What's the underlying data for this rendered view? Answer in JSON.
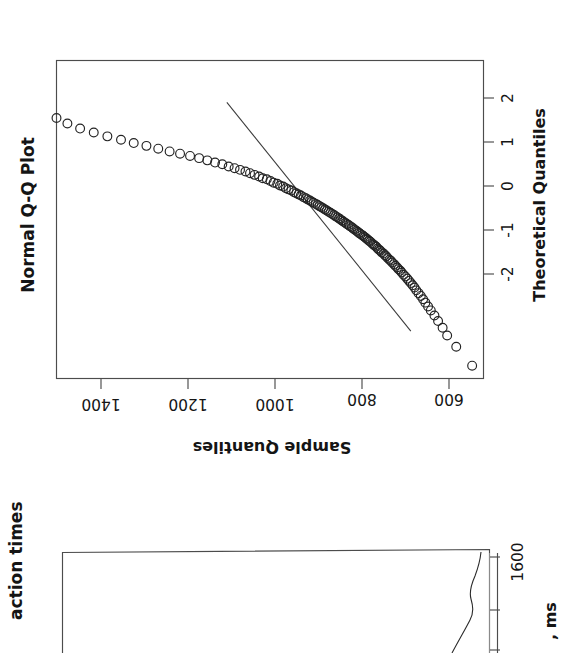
{
  "figure": {
    "orientation": "rotated-90-ccw",
    "background": "#ffffff",
    "ink_color": "#232323"
  },
  "panels": {
    "qq": {
      "title": "Normal Q-Q Plot",
      "x_axis_label": "Theoretical Quantiles",
      "y_axis_label": "Sample Quantiles",
      "x_ticks": [
        "-2",
        "-1",
        "0",
        "1",
        "2"
      ],
      "y_ticks": [
        "600",
        "800",
        "1000",
        "1200",
        "1400"
      ]
    },
    "density": {
      "title_visible_fragment": "action times",
      "x_axis_label_visible_fragment": ", ms",
      "x_ticks_visible": [
        "1600"
      ],
      "note": "panel is cropped by the bottom edge of the screenshot"
    }
  },
  "chart_data": [
    {
      "type": "scatter",
      "title": "Normal Q-Q Plot",
      "xlabel": "Theoretical Quantiles",
      "ylabel": "Sample Quantiles",
      "xlim": [
        -2.85,
        2.85
      ],
      "ylim": [
        540,
        1480
      ],
      "xticks": [
        -2,
        -1,
        0,
        1,
        2
      ],
      "yticks": [
        600,
        800,
        1000,
        1200,
        1400
      ],
      "grid": false,
      "legend": null,
      "marker": "open-circle",
      "reference_line": {
        "label": "qqline",
        "x": [
          -2.0,
          2.1
        ],
        "y": [
          700.0,
          1105.0
        ]
      },
      "x": [
        -2.62,
        -2.28,
        -2.08,
        -1.94,
        -1.82,
        -1.72,
        -1.63,
        -1.56,
        -1.49,
        -1.43,
        -1.37,
        -1.32,
        -1.27,
        -1.22,
        -1.18,
        -1.14,
        -1.1,
        -1.06,
        -1.02,
        -0.99,
        -0.95,
        -0.92,
        -0.89,
        -0.86,
        -0.83,
        -0.8,
        -0.77,
        -0.74,
        -0.72,
        -0.69,
        -0.66,
        -0.64,
        -0.61,
        -0.59,
        -0.56,
        -0.54,
        -0.52,
        -0.49,
        -0.47,
        -0.45,
        -0.43,
        -0.4,
        -0.38,
        -0.36,
        -0.34,
        -0.32,
        -0.3,
        -0.28,
        -0.26,
        -0.24,
        -0.22,
        -0.2,
        -0.18,
        -0.16,
        -0.14,
        -0.12,
        -0.1,
        -0.08,
        -0.06,
        -0.04,
        -0.02,
        0.0,
        0.02,
        0.04,
        0.06,
        0.08,
        0.1,
        0.12,
        0.14,
        0.16,
        0.18,
        0.2,
        0.22,
        0.24,
        0.26,
        0.28,
        0.3,
        0.32,
        0.34,
        0.36,
        0.38,
        0.4,
        0.43,
        0.45,
        0.47,
        0.49,
        0.52,
        0.54,
        0.56,
        0.59,
        0.61,
        0.64,
        0.66,
        0.69,
        0.72,
        0.74,
        0.77,
        0.8,
        0.83,
        0.86,
        0.89,
        0.92,
        0.95,
        0.99,
        1.02,
        1.06,
        1.1,
        1.14,
        1.18,
        1.22,
        1.27,
        1.32,
        1.37,
        1.43,
        1.49,
        1.56,
        1.63,
        1.72,
        1.82,
        1.94,
        2.08,
        2.28,
        2.62
      ],
      "y": [
        565,
        600,
        620,
        630,
        640,
        648,
        656,
        662,
        668,
        673,
        678,
        683,
        688,
        692,
        696,
        700,
        704,
        708,
        712,
        716,
        720,
        723,
        727,
        730,
        734,
        737,
        741,
        744,
        747,
        751,
        754,
        757,
        760,
        764,
        767,
        770,
        773,
        776,
        779,
        782,
        785,
        789,
        792,
        795,
        798,
        801,
        804,
        807,
        811,
        814,
        817,
        820,
        824,
        827,
        830,
        834,
        837,
        841,
        844,
        848,
        851,
        855,
        858,
        862,
        866,
        869,
        873,
        877,
        881,
        885,
        889,
        893,
        897,
        901,
        905,
        909,
        914,
        918,
        922,
        927,
        931,
        936,
        942,
        947,
        952,
        957,
        963,
        969,
        975,
        981,
        988,
        994,
        1002,
        1009,
        1017,
        1026,
        1034,
        1044,
        1054,
        1064,
        1076,
        1088,
        1101,
        1115,
        1131,
        1148,
        1166,
        1186,
        1208,
        1231,
        1256,
        1282,
        1310,
        1338,
        1368,
        1398,
        1428,
        1456,
        1480,
        1508,
        1535,
        1560,
        1580,
        1590,
        1595
      ]
    },
    {
      "type": "line",
      "title_visible_fragment": "action times",
      "xlabel_visible_fragment": ", ms",
      "xticks_visible": [
        1600
      ],
      "grid": false,
      "cropped": true,
      "description": "kernel density curve of reaction times, partially visible at the bottom edge"
    }
  ]
}
